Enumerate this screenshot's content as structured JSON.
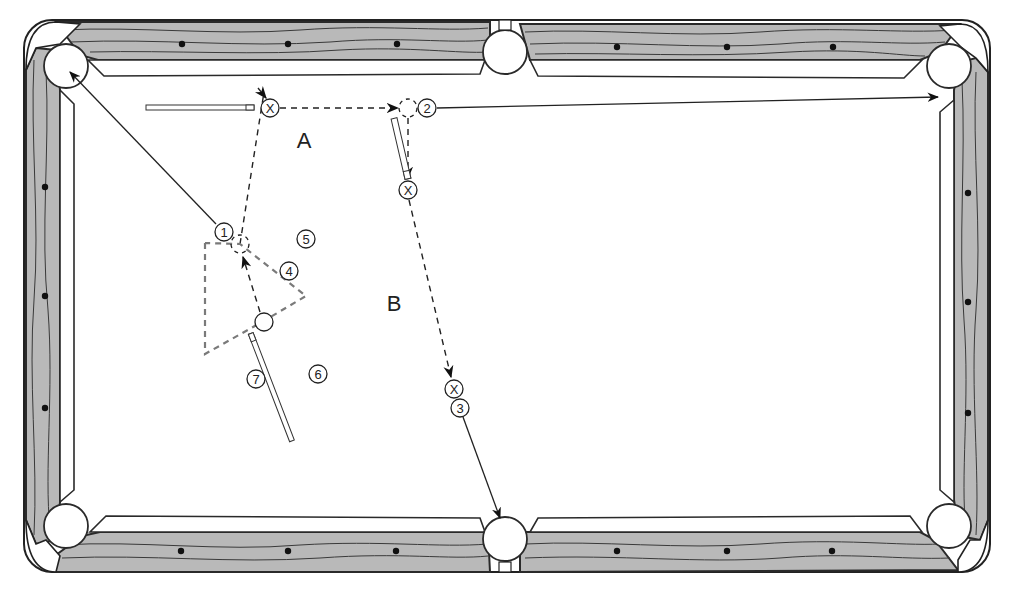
{
  "diagram": {
    "zones": [
      {
        "id": "A",
        "label": "A",
        "x": 304,
        "y": 140
      },
      {
        "id": "B",
        "label": "B",
        "x": 394,
        "y": 303
      }
    ],
    "balls": [
      {
        "id": "1",
        "label": "1",
        "x": 224,
        "y": 232
      },
      {
        "id": "2",
        "label": "2",
        "x": 427,
        "y": 108
      },
      {
        "id": "3",
        "label": "3",
        "x": 460,
        "y": 408
      },
      {
        "id": "4",
        "label": "4",
        "x": 289,
        "y": 271
      },
      {
        "id": "5",
        "label": "5",
        "x": 306,
        "y": 239
      },
      {
        "id": "6",
        "label": "6",
        "x": 318,
        "y": 374
      },
      {
        "id": "7",
        "label": "7",
        "x": 256,
        "y": 379
      }
    ],
    "cue_ball_positions": [
      {
        "id": "x-a",
        "label": "X",
        "x": 270,
        "y": 108
      },
      {
        "id": "x-b1",
        "label": "X",
        "x": 408,
        "y": 190
      },
      {
        "id": "x-b2",
        "label": "X",
        "x": 454,
        "y": 389
      }
    ],
    "cue_ball_start": {
      "x": 264,
      "y": 322
    },
    "ghost_balls": [
      {
        "x": 408,
        "y": 108
      },
      {
        "x": 240,
        "y": 244
      }
    ],
    "pockets": [
      {
        "id": "top-left",
        "x": 66,
        "y": 66
      },
      {
        "id": "top-center",
        "x": 505,
        "y": 52
      },
      {
        "id": "top-right",
        "x": 949,
        "y": 66
      },
      {
        "id": "bottom-left",
        "x": 66,
        "y": 526
      },
      {
        "id": "bottom-center",
        "x": 505,
        "y": 539
      },
      {
        "id": "bottom-right",
        "x": 949,
        "y": 526
      }
    ],
    "diamonds": {
      "top": [
        [
          182,
          44
        ],
        [
          288,
          44
        ],
        [
          397,
          44
        ],
        [
          617,
          47
        ],
        [
          727,
          47
        ],
        [
          833,
          47
        ]
      ],
      "bottom": [
        [
          181,
          551
        ],
        [
          288,
          551
        ],
        [
          396,
          551
        ],
        [
          617,
          551
        ],
        [
          727,
          551
        ],
        [
          832,
          551
        ]
      ],
      "left": [
        [
          45,
          187
        ],
        [
          45,
          296
        ],
        [
          45,
          408
        ]
      ],
      "right": [
        [
          968,
          193
        ],
        [
          968,
          302
        ],
        [
          968,
          413
        ]
      ]
    },
    "paths": {
      "ball1_to_pocket": "1 → top-left pocket",
      "ball2_to_pocket": "2 → top-right rail",
      "ball3_to_pocket": "3 → bottom-center pocket"
    },
    "colors": {
      "rail": "#b9b9b9",
      "line": "#222222",
      "triangle": "#7a7a7a",
      "felt": "#ffffff"
    }
  }
}
